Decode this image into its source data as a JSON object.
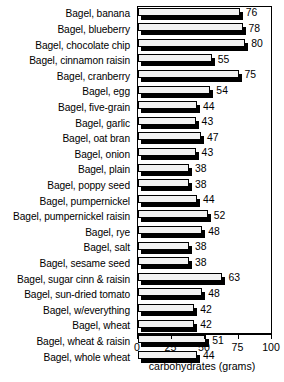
{
  "chart_data": {
    "type": "bar",
    "orientation": "horizontal",
    "title": "",
    "xlabel": "carbohydrates (grams)",
    "ylabel": "",
    "xlim": [
      0,
      100
    ],
    "xticks": [
      0,
      25,
      50,
      75,
      100
    ],
    "grid": false,
    "legend": null,
    "categories": [
      "Bagel, banana",
      "Bagel, blueberry",
      "Bagel, chocolate chip",
      "Bagel, cinnamon raisin",
      "Bagel, cranberry",
      "Bagel, egg",
      "Bagel, five-grain",
      "Bagel, garlic",
      "Bagel, oat bran",
      "Bagel, onion",
      "Bagel, plain",
      "Bagel, poppy seed",
      "Bagel, pumpernickel",
      "Bagel, pumpernickel raisin",
      "Bagel, rye",
      "Bagel, salt",
      "Bagel, sesame seed",
      "Bagel, sugar cinn & raisin",
      "Bagel, sun-dried tomato",
      "Bagel, w/everything",
      "Bagel, wheat",
      "Bagel, wheat & raisin",
      "Bagel, whole wheat"
    ],
    "values": [
      76,
      78,
      80,
      55,
      75,
      54,
      44,
      43,
      47,
      43,
      38,
      38,
      44,
      52,
      48,
      38,
      38,
      63,
      48,
      42,
      42,
      51,
      44
    ],
    "data_labels": [
      "76",
      "78",
      "80",
      "55",
      "75",
      "54",
      "44",
      "43",
      "47",
      "43",
      "38",
      "38",
      "44",
      "52",
      "48",
      "38",
      "38",
      "63",
      "48",
      "42",
      "42",
      "51",
      "44"
    ]
  },
  "axis": {
    "tick_labels": [
      "0",
      "25",
      "50",
      "75",
      "100"
    ],
    "title": "carbohydrates (grams)"
  },
  "top_cutoff_text": "",
  "colors": {
    "bar_face": "#f2f2f2",
    "bar_outline": "#000000",
    "bar_shadow": "#000000",
    "text": "#000000",
    "background": "#ffffff"
  }
}
